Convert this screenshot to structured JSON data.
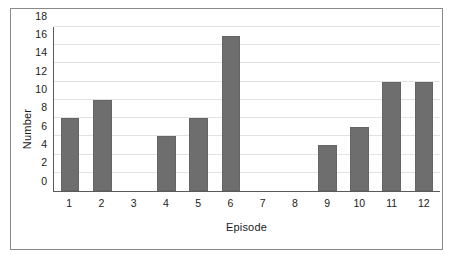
{
  "chart_data": {
    "type": "bar",
    "title": "",
    "xlabel": "Episode",
    "ylabel": "Number",
    "categories": [
      "1",
      "2",
      "3",
      "4",
      "5",
      "6",
      "7",
      "8",
      "9",
      "10",
      "11",
      "12"
    ],
    "values": [
      8,
      10,
      0,
      6,
      8,
      17,
      0,
      0,
      5,
      7,
      12,
      12
    ],
    "ylim": [
      0,
      18
    ],
    "yticks": [
      0,
      2,
      4,
      6,
      8,
      10,
      12,
      14,
      16,
      18
    ],
    "ytick_labels": [
      "0",
      "2",
      "4",
      "6",
      "8",
      "10",
      "12",
      "14",
      "16",
      "18"
    ],
    "grid": true,
    "legend": false,
    "bar_color": "#6e6e6e",
    "gridline_color": "#e2e2e2",
    "axis_color": "#5a5a5a",
    "frame_color": "#8a8a8a",
    "background_color": "#ffffff"
  }
}
